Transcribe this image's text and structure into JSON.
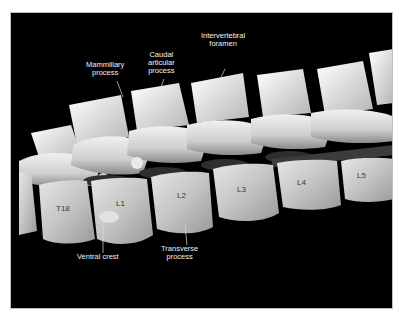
{
  "figure": {
    "background_color": "#000000",
    "bone_color": "#d9d9d9",
    "annotations": [
      {
        "id": "mammillary",
        "line1": "Mammillary",
        "line2": "process"
      },
      {
        "id": "caudal",
        "line1": "Caudal",
        "line2": "articular",
        "line3": "process"
      },
      {
        "id": "foramen",
        "line1": "Intervertebral",
        "line2": "foramen"
      },
      {
        "id": "ventral",
        "line1": "Ventral crest"
      },
      {
        "id": "transverse",
        "line1": "Transverse",
        "line2": "process"
      }
    ],
    "vertebrae": [
      "T18",
      "L1",
      "L2",
      "L3",
      "L4",
      "L5"
    ]
  }
}
